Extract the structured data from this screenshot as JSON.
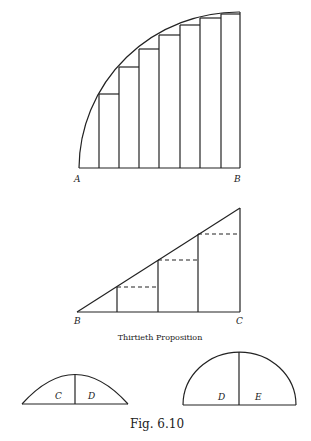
{
  "figure": {
    "caption": "Fig. 6.10",
    "stroke_color": "#222222",
    "background": "#ffffff"
  },
  "quarter_circle": {
    "labels": {
      "left": "A",
      "right": "B"
    },
    "bars": 8
  },
  "triangle": {
    "labels": {
      "left": "B",
      "right": "C"
    },
    "caption": "Thirtieth Proposition"
  },
  "segments": {
    "small": {
      "left": "C",
      "right": "D"
    },
    "large": {
      "left": "D",
      "right": "E"
    }
  }
}
